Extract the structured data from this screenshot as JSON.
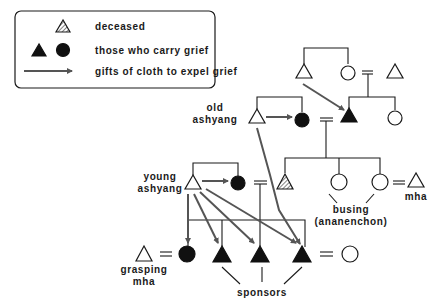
{
  "legend": {
    "items": [
      {
        "symbol": "hatched-triangle",
        "label": "deceased"
      },
      {
        "symbol": "filled-triangle-and-circle",
        "label": "those who carry grief"
      },
      {
        "symbol": "arrow",
        "label": "gifts of cloth to expel grief"
      }
    ]
  },
  "labels": {
    "old_ashyang_1": "old",
    "old_ashyang_2": "ashyang",
    "young_ashyang_1": "young",
    "young_ashyang_2": "ashyang",
    "busing_1": "busing",
    "busing_2": "(ananenchon)",
    "mha": "mha",
    "grasping_1": "grasping",
    "grasping_2": "mha",
    "sponsors": "sponsors"
  },
  "colors": {
    "line": "#1a1a1a",
    "arrow": "#555555",
    "filled": "#111111"
  },
  "icons": {
    "male": "triangle",
    "female": "circle",
    "marriage": "double-equals"
  }
}
